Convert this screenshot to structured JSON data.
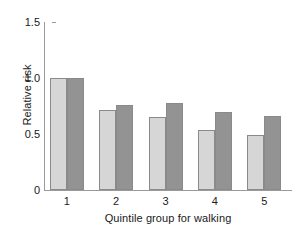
{
  "chart_data": {
    "type": "bar",
    "title": "",
    "xlabel": "Quintile group for walking",
    "ylabel": "Relative risk",
    "categories": [
      "1",
      "2",
      "3",
      "4",
      "5"
    ],
    "series": [
      {
        "name": "light-series",
        "color": "#d6d6d6",
        "values": [
          1.0,
          0.71,
          0.65,
          0.54,
          0.49
        ]
      },
      {
        "name": "dark-series",
        "color": "#939393",
        "values": [
          1.0,
          0.76,
          0.78,
          0.7,
          0.66
        ]
      }
    ],
    "ylim": [
      0,
      1.5
    ],
    "yticks": [
      0,
      0.5,
      1.0,
      1.5
    ],
    "ytick_labels": [
      "0",
      "0.5",
      "1.0",
      "1.5"
    ],
    "grid": false,
    "legend": "none",
    "axis_color": "#9a9a9a",
    "bar_border_color": "#8a8a8a",
    "background": "#ffffff"
  }
}
